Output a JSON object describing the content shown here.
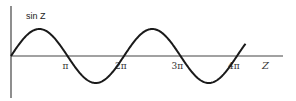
{
  "chart_data": {
    "type": "line",
    "title": "",
    "function_label": "sin Z",
    "xlabel": "Z",
    "ylabel": "sin Z",
    "xlim_radians": [
      0,
      13.1
    ],
    "ylim": [
      -1,
      1
    ],
    "grid": false,
    "legend": "none",
    "x_ticks": [
      {
        "value_over_pi": 1,
        "label": "π"
      },
      {
        "value_over_pi": 2,
        "label": "2π"
      },
      {
        "value_over_pi": 3,
        "label": "3π"
      },
      {
        "value_over_pi": 4,
        "label": "4π"
      }
    ],
    "series": [
      {
        "name": "sin Z",
        "function": "sin",
        "x_start": 0,
        "x_end_over_pi": 4.15,
        "amplitude": 1
      }
    ],
    "colors": {
      "line": "#1a1a1a",
      "axis": "#444444"
    }
  }
}
